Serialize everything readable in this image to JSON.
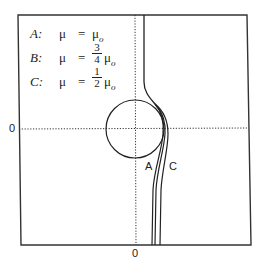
{
  "figure": {
    "legend": [
      {
        "key": "A:",
        "mu": "μ",
        "eq": "=",
        "coef_num": "",
        "coef_den": "",
        "rhs": "μ",
        "rhs_sub": "o"
      },
      {
        "key": "B:",
        "mu": "μ",
        "eq": "=",
        "coef_num": "3",
        "coef_den": "4",
        "rhs": "μ",
        "rhs_sub": "o"
      },
      {
        "key": "C:",
        "mu": "μ",
        "eq": "=",
        "coef_num": "1",
        "coef_den": "2",
        "rhs": "μ",
        "rhs_sub": "o"
      }
    ],
    "axes": {
      "x_zero_label": "0",
      "y_zero_label": "0",
      "axis_style": "dotted"
    },
    "curve_labels": {
      "A": "A",
      "C": "C"
    },
    "colors": {
      "line": "#222222",
      "frame": "#333333",
      "background": "#ffffff"
    }
  }
}
